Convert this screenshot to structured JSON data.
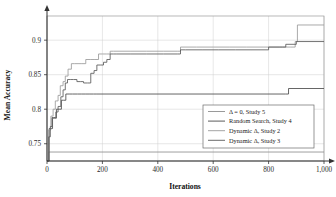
{
  "chart_data": {
    "type": "line",
    "title": "",
    "xlabel": "Iterations",
    "ylabel": "Mean Accuracy",
    "xlim": [
      0,
      1000
    ],
    "ylim": [
      0.725,
      0.935
    ],
    "grid": true,
    "legend_position": "lower-right",
    "xticks": [
      0,
      200,
      400,
      600,
      800,
      1000
    ],
    "xtick_labels": [
      "0",
      "200",
      "400",
      "600",
      "800",
      "1,000"
    ],
    "yticks": [
      0.75,
      0.8,
      0.85,
      0.9
    ],
    "ytick_labels": [
      "0.75",
      "0.8",
      "0.85",
      "0.9"
    ],
    "series": [
      {
        "name": "delta-0-study-5",
        "label": "Δ = 0, Study 5",
        "color": "#8f8f8f",
        "x": [
          0,
          6,
          1000
        ],
        "y": [
          0.725,
          0.738,
          0.738
        ]
      },
      {
        "name": "random-search-study-4",
        "label": "Random Search, Study 4",
        "color": "#4a4a4a",
        "x": [
          0,
          8,
          14,
          20,
          26,
          34,
          44,
          52,
          60,
          68,
          80,
          92,
          110,
          124,
          140,
          152,
          168,
          180,
          860,
          872,
          1000
        ],
        "y": [
          0.725,
          0.772,
          0.772,
          0.787,
          0.787,
          0.8,
          0.8,
          0.813,
          0.813,
          0.822,
          0.822,
          0.822,
          0.822,
          0.822,
          0.822,
          0.822,
          0.822,
          0.822,
          0.822,
          0.83,
          0.83
        ]
      },
      {
        "name": "dynamic-delta-study-2",
        "label": "Dynamic Δ, Study 2",
        "color": "#9b9b9b",
        "x": [
          0,
          6,
          14,
          22,
          30,
          40,
          48,
          58,
          66,
          76,
          88,
          100,
          112,
          126,
          140,
          156,
          170,
          186,
          200,
          214,
          228,
          240,
          300,
          360,
          420,
          470,
          482,
          540,
          600,
          660,
          720,
          780,
          840,
          880,
          896,
          904,
          1000
        ],
        "y": [
          0.725,
          0.77,
          0.79,
          0.8,
          0.812,
          0.82,
          0.834,
          0.84,
          0.848,
          0.858,
          0.866,
          0.866,
          0.866,
          0.866,
          0.872,
          0.872,
          0.872,
          0.88,
          0.88,
          0.88,
          0.884,
          0.884,
          0.884,
          0.884,
          0.884,
          0.884,
          0.89,
          0.89,
          0.89,
          0.89,
          0.89,
          0.89,
          0.89,
          0.89,
          0.898,
          0.922,
          0.922
        ]
      },
      {
        "name": "dynamic-delta-study-3",
        "label": "Dynamic Δ, Study 3",
        "color": "#5a5a5a",
        "x": [
          0,
          6,
          12,
          18,
          24,
          32,
          40,
          50,
          58,
          66,
          74,
          84,
          96,
          108,
          120,
          132,
          146,
          158,
          170,
          180,
          192,
          204,
          216,
          228,
          240,
          252,
          300,
          360,
          420,
          470,
          482,
          500,
          560,
          620,
          680,
          740,
          800,
          850,
          862,
          900,
          1000
        ],
        "y": [
          0.725,
          0.76,
          0.775,
          0.788,
          0.788,
          0.796,
          0.804,
          0.818,
          0.828,
          0.838,
          0.843,
          0.843,
          0.843,
          0.84,
          0.84,
          0.838,
          0.838,
          0.852,
          0.856,
          0.864,
          0.864,
          0.868,
          0.872,
          0.88,
          0.88,
          0.88,
          0.88,
          0.88,
          0.88,
          0.88,
          0.886,
          0.886,
          0.886,
          0.886,
          0.886,
          0.886,
          0.89,
          0.89,
          0.894,
          0.898,
          0.898
        ]
      }
    ]
  },
  "axes": {
    "y_title": "Mean Accuracy",
    "x_title": "Iterations"
  },
  "legend": {
    "entries": [
      "Δ = 0, Study 5",
      "Random Search, Study 4",
      "Dynamic Δ, Study 2",
      "Dynamic Δ, Study 3"
    ]
  }
}
